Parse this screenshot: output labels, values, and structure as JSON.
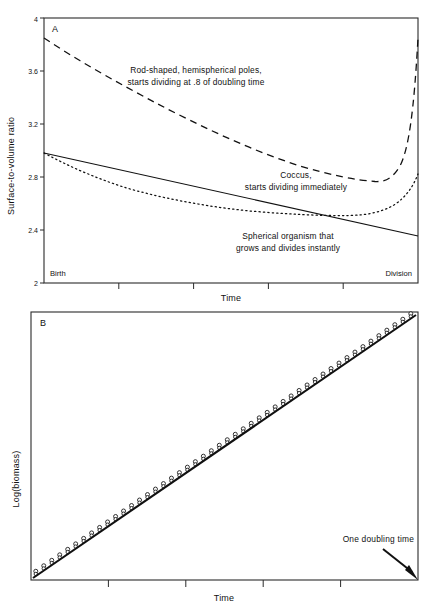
{
  "figure": {
    "panels": [
      "A",
      "B"
    ]
  },
  "panel_a": {
    "letter": "A",
    "y_title": "Surface-to-volume  ratio",
    "x_title": "Time",
    "y_ticks": [
      "2",
      "2.4",
      "2.8",
      "3.2",
      "3.6",
      "4"
    ],
    "left_edge_label": "Birth",
    "right_edge_label": "Division",
    "labels": {
      "rod_line1": "Rod-shaped, hemispherical poles,",
      "rod_line2": "starts dividing at .8 of doubling time",
      "coccus_line1": "Coccus,",
      "coccus_line2": "starts dividing immediately",
      "sphere_line1": "Spherical organism that",
      "sphere_line2": "grows and divides instantly"
    }
  },
  "panel_b": {
    "letter": "B",
    "y_title": "Log(biomass)",
    "x_title": "Time",
    "annotation": "One doubling time"
  },
  "chart_data": [
    {
      "type": "line",
      "title": "A",
      "xlabel": "Time",
      "ylabel": "Surface-to-volume  ratio",
      "xlim": [
        0,
        1
      ],
      "ylim": [
        2,
        4
      ],
      "x_tick_labels": [
        "Birth",
        "Division"
      ],
      "y_tick_labels": [
        "2",
        "2.4",
        "2.8",
        "3.2",
        "3.6",
        "4"
      ],
      "y_ticks": [
        2,
        2.4,
        2.8,
        3.2,
        3.6,
        4
      ],
      "x_ticks": [
        0,
        0.2,
        0.4,
        0.6,
        0.8,
        1.0
      ],
      "grid": false,
      "legend": "inline annotations",
      "series": [
        {
          "name": "Rod-shaped, hemispherical poles, starts dividing at .8 of doubling time",
          "style": "dashed",
          "x": [
            0,
            0.1,
            0.2,
            0.3,
            0.4,
            0.5,
            0.6,
            0.7,
            0.8,
            0.85,
            0.9,
            0.95,
            1.0
          ],
          "y": [
            3.62,
            3.49,
            3.36,
            3.25,
            3.15,
            3.06,
            2.99,
            2.92,
            2.87,
            2.86,
            2.93,
            3.2,
            3.62
          ]
        },
        {
          "name": "Coccus, starts dividing immediately",
          "style": "dotted",
          "x": [
            0,
            0.1,
            0.2,
            0.3,
            0.4,
            0.5,
            0.6,
            0.7,
            0.8,
            0.85,
            0.9,
            0.95,
            1.0
          ],
          "y": [
            3.02,
            2.92,
            2.84,
            2.78,
            2.73,
            2.7,
            2.67,
            2.66,
            2.65,
            2.66,
            2.69,
            2.76,
            2.86
          ]
        },
        {
          "name": "Spherical organism that grows and divides instantly",
          "style": "solid",
          "x": [
            0,
            0.25,
            0.5,
            0.75,
            1.0
          ],
          "y": [
            3.02,
            2.86,
            2.71,
            2.55,
            2.39
          ]
        }
      ]
    },
    {
      "type": "scatter",
      "title": "B",
      "xlabel": "Time",
      "ylabel": "Log(biomass)",
      "xlim": [
        0,
        1
      ],
      "ylim": [
        0,
        1
      ],
      "x_ticks": [
        0,
        0.2,
        0.4,
        0.6,
        0.8,
        1.0
      ],
      "y_tick_labels": [],
      "grid": false,
      "annotation": "One doubling time",
      "series": [
        {
          "name": "Exponential growth (log-linear trend)",
          "style": "solid-thick-line",
          "x": [
            0,
            1
          ],
          "y": [
            0,
            1
          ]
        },
        {
          "name": "Discrete division events (open circles, staircase)",
          "style": "open-circle-markers",
          "n_markers": 48,
          "marker_offset_above_line": 0.012,
          "x_start": 0.0,
          "x_end": 1.0,
          "y_start": 0.0,
          "y_end": 1.0
        }
      ]
    }
  ]
}
